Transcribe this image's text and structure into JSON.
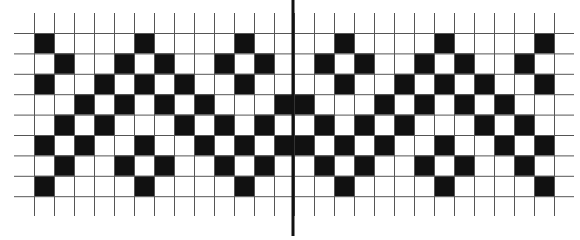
{
  "diagram": {
    "type": "pattern-grid",
    "colors": {
      "background": "#ffffff",
      "filled_cell": "#111111",
      "grid_line": "#555555",
      "divider": "#111111"
    },
    "grid": {
      "columns": 26,
      "rows": 8,
      "origin_x": 34,
      "origin_y": 33,
      "cell_width": 20,
      "cell_height": 20.4,
      "vertical_line_top": 13,
      "vertical_line_bottom": 216,
      "horizontal_line_left": 14,
      "horizontal_line_right": 574
    },
    "divider": {
      "x": 293,
      "top": 0,
      "bottom": 236,
      "width": 3
    },
    "filled_cells": [
      [
        0,
        5,
        10,
        15,
        20,
        25
      ],
      [
        1,
        4,
        6,
        9,
        11,
        14,
        16,
        19,
        21,
        24
      ],
      [
        0,
        3,
        5,
        7,
        10,
        15,
        18,
        20,
        22,
        25
      ],
      [
        2,
        4,
        6,
        8,
        12,
        13,
        17,
        19,
        21,
        23
      ],
      [
        1,
        3,
        7,
        9,
        11,
        14,
        16,
        18,
        22,
        24
      ],
      [
        0,
        2,
        5,
        8,
        10,
        12,
        13,
        15,
        17,
        20,
        23,
        25
      ],
      [
        1,
        4,
        6,
        9,
        11,
        14,
        16,
        19,
        21,
        24
      ],
      [
        0,
        5,
        10,
        15,
        20,
        25
      ]
    ]
  }
}
